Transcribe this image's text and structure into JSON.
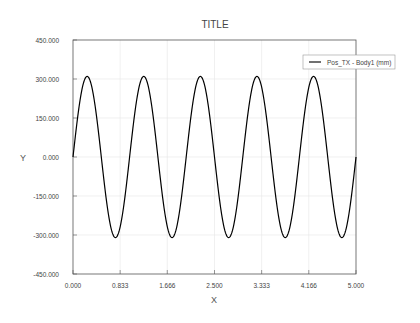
{
  "chart_data": {
    "type": "line",
    "title": "TITLE",
    "xlabel": "X",
    "ylabel": "Y",
    "xlim": [
      0,
      5
    ],
    "ylim": [
      -450,
      450
    ],
    "x_ticks": [
      "0.000",
      "0.833",
      "1.666",
      "2.500",
      "3.333",
      "4.166",
      "5.000"
    ],
    "y_ticks": [
      "450.000",
      "300.000",
      "150.000",
      "0.000",
      "-150.000",
      "-300.000",
      "-450.000"
    ],
    "grid": true,
    "legend_position": "upper right",
    "series": [
      {
        "name": "Pos_TX - Body1 (mm)",
        "color": "#000000",
        "function": "310*sin(2*pi*t)",
        "amplitude": 310,
        "period": 1.0,
        "x": [
          0,
          0.25,
          0.5,
          0.75,
          1.0,
          1.25,
          1.5,
          1.75,
          2.0,
          2.25,
          2.5,
          2.75,
          3.0,
          3.25,
          3.5,
          3.75,
          4.0,
          4.25,
          4.5,
          4.75,
          5.0
        ],
        "values": [
          0,
          310,
          0,
          -310,
          0,
          310,
          0,
          -310,
          0,
          310,
          0,
          -310,
          0,
          310,
          0,
          -310,
          0,
          310,
          0,
          -310,
          0
        ]
      }
    ]
  }
}
